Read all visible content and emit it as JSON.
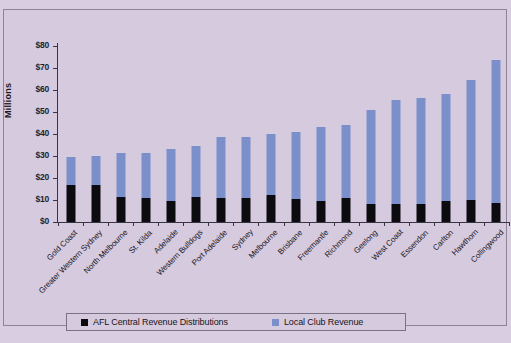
{
  "chart_data": {
    "type": "bar",
    "subtype": "stacked-vertical",
    "title": "",
    "xlabel": "",
    "ylabel": "Millions",
    "ylim": [
      0,
      80
    ],
    "ytick_labels": [
      "$80",
      "$70",
      "$60",
      "$50",
      "$40",
      "$30",
      "$20",
      "$10",
      "$0"
    ],
    "ytick_values": [
      80,
      70,
      60,
      50,
      40,
      30,
      20,
      10,
      0
    ],
    "grid": false,
    "legend_position": "bottom",
    "categories": [
      "Gold Coast",
      "Greater Western Sydney",
      "North Melbourne",
      "St. Kilda",
      "Adelaide",
      "Western Bulldogs",
      "Port Adelaide",
      "Sydney",
      "Melbourne",
      "Brisbane",
      "Freemantle",
      "Richmond",
      "Geelong",
      "West Coast",
      "Essendon",
      "Carlton",
      "Hawthorn",
      "Collingwood"
    ],
    "series": [
      {
        "name": "AFL Central Revenue Distributions",
        "color": "#0b0b10",
        "values": [
          16.6,
          16.7,
          11.5,
          10.7,
          9.6,
          11.2,
          11.0,
          10.9,
          12.2,
          10.3,
          9.4,
          11.1,
          8.4,
          8.4,
          8.4,
          9.5,
          10.2,
          8.6
        ]
      },
      {
        "name": "Local Club Revenue",
        "color": "#7b8fcb",
        "values": [
          12.9,
          13.4,
          20.0,
          20.6,
          23.8,
          23.3,
          27.6,
          27.8,
          28.0,
          30.5,
          33.8,
          33.0,
          42.5,
          46.9,
          48.2,
          48.5,
          54.5,
          64.9
        ]
      }
    ],
    "totals": [
      29.5,
      30.1,
      31.5,
      31.3,
      33.4,
      34.5,
      38.6,
      38.7,
      40.2,
      40.8,
      43.2,
      44.1,
      50.9,
      55.3,
      56.6,
      58.0,
      64.7,
      73.5
    ]
  },
  "legend": {
    "items": [
      {
        "label": "AFL Central Revenue Distributions",
        "color": "#0b0b10"
      },
      {
        "label": "Local Club Revenue",
        "color": "#7b8fcb"
      }
    ]
  }
}
